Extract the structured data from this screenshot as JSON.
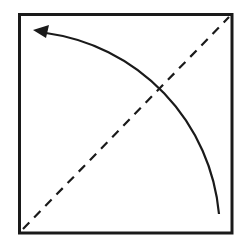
{
  "diagram": {
    "colors": {
      "background": "#ffffff",
      "stroke": "#1a1a1a"
    },
    "square": {
      "x": 19,
      "y": 14,
      "width": 213,
      "height": 219,
      "stroke_width": 3
    },
    "diagonal": {
      "x1": 22,
      "y1": 230,
      "x2": 229,
      "y2": 17,
      "style": "dashed"
    },
    "arc": {
      "center": [
        19,
        233
      ],
      "radius": 201,
      "start": [
        219,
        214
      ],
      "end": [
        46,
        33
      ],
      "arrowhead": "end",
      "arrow_tip": [
        34,
        30
      ]
    }
  }
}
